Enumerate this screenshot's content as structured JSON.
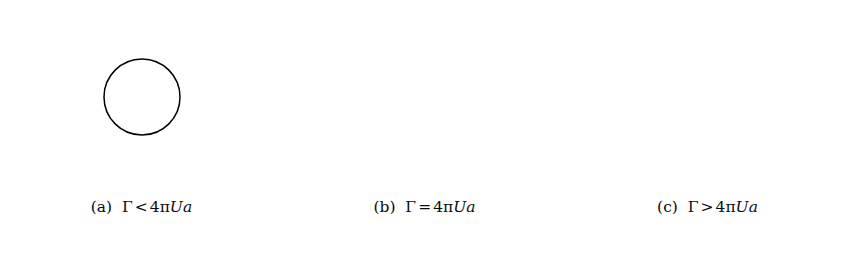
{
  "figure": {
    "background_color": "#ffffff",
    "line_color": "#2b2b2b",
    "cylinder_stroke_color": "#000000",
    "caption_color": "#0a0a0a"
  },
  "panels": [
    {
      "id": "a",
      "label": "(a)",
      "caption_full": "(a)  Γ < 4πUa",
      "symbol": "Γ",
      "relation": "<",
      "coefficient": "4",
      "pi": "π",
      "speed_symbol": "U",
      "radius_symbol": "a",
      "regime": "subcritical",
      "description": "Circulation below critical value; two stagnation points lie on the cylinder surface below the horizontal midline and all streamlines pass around the cylinder.",
      "stagnation_points_on_cylinder": 2,
      "stagnation_point_free": false,
      "cylinder": {
        "cx": 142,
        "cy": 97,
        "r": 38
      },
      "circulation_ratio": 1.55
    },
    {
      "id": "b",
      "label": "(b)",
      "caption_full": "(b)  Γ = 4πUa",
      "symbol": "Γ",
      "relation": "=",
      "coefficient": "4",
      "pi": "π",
      "speed_symbol": "U",
      "radius_symbol": "a",
      "regime": "critical",
      "description": "Critical circulation; the two stagnation points merge into a single cusp at the lowest point of the cylinder.",
      "stagnation_points_on_cylinder": 1,
      "stagnation_point_free": false,
      "cylinder": {
        "cx": 424,
        "cy": 50,
        "r": 46
      },
      "circulation_ratio": 2.0
    },
    {
      "id": "c",
      "label": "(c)",
      "caption_full": "(c)  Γ > 4πUa",
      "symbol": "Γ",
      "relation": ">",
      "coefficient": "4",
      "pi": "π",
      "speed_symbol": "U",
      "radius_symbol": "a",
      "regime": "supercritical",
      "description": "Circulation above critical value; the stagnation point detaches from the cylinder into the fluid below it, forming a saddle point with a closed region of recirculating fluid around the cylinder.",
      "stagnation_points_on_cylinder": 0,
      "stagnation_point_free": true,
      "cylinder": {
        "cx": 711,
        "cy": 40,
        "r": 42
      },
      "saddle_point": {
        "x": 709,
        "y": 112
      },
      "circulation_ratio": 2.62
    }
  ],
  "chart_data": {
    "type": "line",
    "stream_function": "psi = U*y*(1 - a^2/r^2) + (Gamma/(2*pi))*ln(r/a)",
    "xlabel": "",
    "ylabel": "",
    "grid": false,
    "legend": false,
    "series_count": 3,
    "series": [
      {
        "name": "(a) Gamma < 4 pi U a",
        "circulation_ratio": 1.55,
        "n_streamlines": 19,
        "inflow_y_min": -1.95,
        "inflow_y_max": 1.15,
        "cylinder_radius": 1.0
      },
      {
        "name": "(b) Gamma = 4 pi U a",
        "circulation_ratio": 2.0,
        "n_streamlines": 19,
        "inflow_y_min": -2.1,
        "inflow_y_max": 1.0,
        "cylinder_radius": 1.0
      },
      {
        "name": "(c) Gamma > 4 pi U a",
        "circulation_ratio": 2.62,
        "n_streamlines": 19,
        "inflow_y_min": -2.3,
        "inflow_y_max": 0.85,
        "cylinder_radius": 1.0
      }
    ]
  }
}
